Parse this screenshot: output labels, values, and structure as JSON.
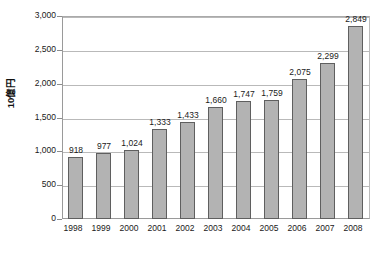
{
  "chart_data": {
    "type": "bar",
    "title": "",
    "subtitle": "",
    "xlabel": "",
    "ylabel": "10億円",
    "categories": [
      "1998",
      "1999",
      "2000",
      "2001",
      "2002",
      "2003",
      "2004",
      "2005",
      "2006",
      "2007",
      "2008"
    ],
    "values": [
      918,
      977,
      1024,
      1333,
      1433,
      1660,
      1747,
      1759,
      2075,
      2299,
      2849
    ],
    "value_labels": [
      "918",
      "977",
      "1,024",
      "1,333",
      "1,433",
      "1,660",
      "1,747",
      "1,759",
      "2,075",
      "2,299",
      "2,849"
    ],
    "ylim": [
      0,
      3000
    ],
    "ytick_values": [
      0,
      500,
      1000,
      1500,
      2000,
      2500,
      3000
    ],
    "ytick_labels": [
      "0",
      "500",
      "1,000",
      "1,500",
      "2,000",
      "2,500",
      "3,000"
    ],
    "grid": true,
    "grid_axis": "y",
    "legend": false,
    "legend_position": "none",
    "series": [
      {
        "name": "",
        "values": [
          918,
          977,
          1024,
          1333,
          1433,
          1660,
          1747,
          1759,
          2075,
          2299,
          2849
        ]
      }
    ]
  },
  "style": {
    "bar_fill": "#b3b3b3",
    "bar_border": "#5f5f5f",
    "gridline_color": "#b9b9b9",
    "frame_color": "#9a9a9a",
    "text_color": "#1a1a1a",
    "background": "#ffffff"
  },
  "caption": {
    "text": ""
  }
}
